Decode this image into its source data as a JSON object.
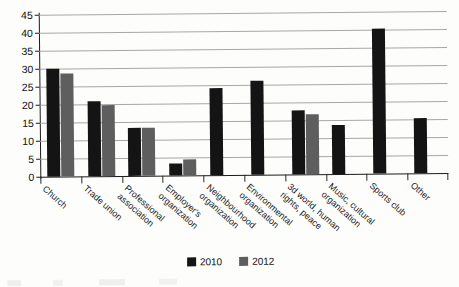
{
  "chart_data": {
    "type": "bar",
    "title": "",
    "xlabel": "",
    "ylabel": "",
    "ylim": [
      0,
      45
    ],
    "ytick_step": 5,
    "yticks": [
      0,
      5,
      10,
      15,
      20,
      25,
      30,
      35,
      40,
      45
    ],
    "grid": true,
    "legend_position": "bottom-center",
    "categories": [
      "Church",
      "Trade union",
      "Professional association",
      "Employer's organization",
      "Neighbourhood organization",
      "Environmental organization",
      "3d world, human rights, peace",
      "Music, cultural organization",
      "Sports club",
      "Other"
    ],
    "category_lines": [
      [
        "Church"
      ],
      [
        "Trade union"
      ],
      [
        "Professional",
        "association"
      ],
      [
        "Employer's",
        "organization"
      ],
      [
        "Neighbourhood",
        "organization"
      ],
      [
        "Environmental",
        "organization"
      ],
      [
        "3d world, human",
        "rights, peace"
      ],
      [
        "Music, cultural",
        "organization"
      ],
      [
        "Sports club"
      ],
      [
        "Other"
      ]
    ],
    "series": [
      {
        "name": "2010",
        "color": "#141414",
        "values": [
          30,
          20.7,
          13.4,
          3.4,
          24.2,
          26.1,
          17.9,
          13.7,
          40.4,
          15.4
        ]
      },
      {
        "name": "2012",
        "color": "#5e5e5e",
        "values": [
          28.7,
          19.8,
          13.2,
          4.4,
          null,
          null,
          16.8,
          null,
          null,
          null
        ]
      }
    ]
  },
  "legend": {
    "items": [
      {
        "label": "2010",
        "color": "#141414"
      },
      {
        "label": "2012",
        "color": "#5e5e5e"
      }
    ]
  },
  "axis": {
    "y_max_label": "45",
    "y_min_label": "0"
  }
}
